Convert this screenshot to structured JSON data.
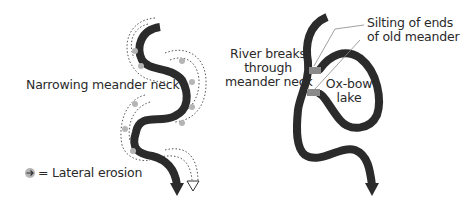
{
  "left_panel": {
    "label_neck": "Narrowing meander neck",
    "legend_text": "= Lateral erosion",
    "legend_icon": "lateral-erosion-icon"
  },
  "right_panel": {
    "label_breaks_line1": "River breaks",
    "label_breaks_line2": "through",
    "label_breaks_line3": "meander neck",
    "label_silting_line1": "Silting of ends",
    "label_silting_line2": "of old meander",
    "label_oxbow_line1": "Ox-bow",
    "label_oxbow_line2": "lake"
  },
  "colors": {
    "river": "#2b2b2b",
    "silt": "#8a8a8a",
    "erosion_dot": "#b5b5b5",
    "dotted_line": "#555555",
    "text": "#2a2a2a"
  }
}
